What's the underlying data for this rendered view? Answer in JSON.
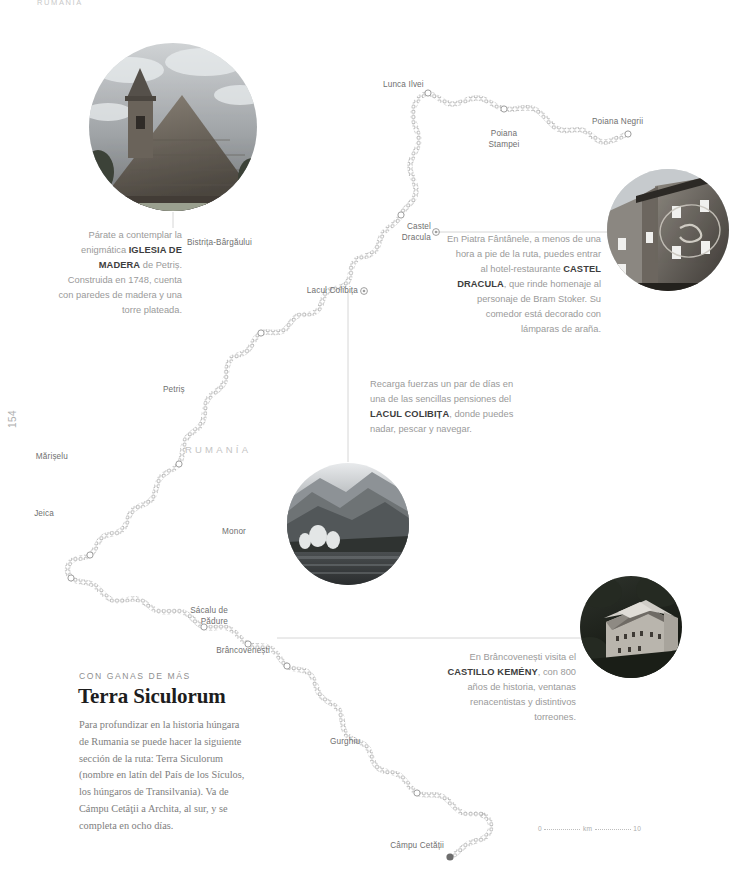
{
  "running_head": "RUMANÍA",
  "folio": "154",
  "country_label": "RUMANÍA",
  "map": {
    "places": [
      {
        "name": "Lunca Ilvei"
      },
      {
        "name": "Poiana\nStampei"
      },
      {
        "name": "Poiana Negrii"
      },
      {
        "name": "Castel"
      },
      {
        "name": "Dracula"
      },
      {
        "name": "Bistrița-Bârgăului"
      },
      {
        "name": "Lacul Colibița"
      },
      {
        "name": "Petriș"
      },
      {
        "name": "Mărișelu"
      },
      {
        "name": "Jeica"
      },
      {
        "name": "Monor"
      },
      {
        "name": "Sácalu de"
      },
      {
        "name": "Pădure"
      },
      {
        "name": "Brâncovenești"
      },
      {
        "name": "Gurghiu"
      },
      {
        "name": "Câmpu Cetății"
      }
    ],
    "labels": {
      "lunca_ilvei": "Lunca Ilvei",
      "poiana_stampei_1": "Poiana",
      "poiana_stampei_2": "Stampei",
      "poiana_negrii": "Poiana Negrii",
      "castel_1": "Castel",
      "castel_2": "Dracula",
      "bistrita": "Bistrița-Bârgăului",
      "lacul_colibita": "Lacul Colibița",
      "petris": "Petriș",
      "mariselu": "Mărișelu",
      "jeica": "Jeica",
      "monor": "Monor",
      "sacalu_1": "Sácalu de",
      "sacalu_2": "Pădure",
      "brancovenesti": "Brâncovenești",
      "gurghiu": "Gurghiu",
      "campu_cetatii": "Câmpu Cetății"
    },
    "scale": {
      "left": "0",
      "unit": "km",
      "right": "10"
    }
  },
  "photos": {
    "church": {
      "alt": "iglesia-de-madera-photo"
    },
    "dracula": {
      "alt": "hotel-castel-dracula-photo"
    },
    "lake": {
      "alt": "lacul-colibita-photo"
    },
    "castle": {
      "alt": "castillo-kemeny-photo"
    }
  },
  "captions": {
    "church": {
      "pre": "Párate a contemplar la enigmática ",
      "bold": "IGLESIA DE MADERA",
      "post": " de Petriș. Construida en 1748, cuenta con paredes de madera y una torre plateada."
    },
    "dracula": {
      "pre": "En Piatra Fântânele, a menos de una hora a pie de la ruta, puedes entrar al hotel-restaurante ",
      "bold": "CASTEL DRACULA",
      "post": ", que rinde homenaje al personaje de Bram Stoker. Su comedor está decorado con lámparas de araña."
    },
    "lake": {
      "pre": "Recarga fuerzas un par de días en una de las sencillas pensiones del ",
      "bold": "LACUL COLIBIȚA",
      "post": ", donde puedes nadar, pescar y navegar."
    },
    "castle": {
      "pre": "En Brâncovenești visita el ",
      "bold": "CASTILLO KEMÉNY",
      "post": ", con 800 años de historia, ventanas renacentistas y distintivos torreones."
    }
  },
  "story": {
    "kicker": "CON GANAS DE MÁS",
    "title": "Terra Siculorum",
    "body": "Para profundizar en la historia húngara de Rumania se puede hacer la siguiente sección de la ruta: Terra Siculorum (nombre en latín del País de los Sículos, los húngaros de Transilvania). Va de Cámpu Cetăţii a Archita, al sur, y se completa en ocho días."
  },
  "colors": {
    "route": "#a5a5a5",
    "text": "#9a9a9a",
    "bold_text": "#3d3d3d",
    "leader": "#d3d3d3",
    "country": "#c4c4c4"
  }
}
